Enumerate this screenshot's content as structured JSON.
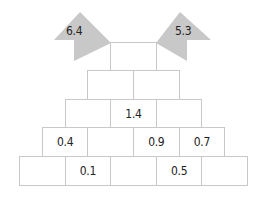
{
  "flags": [
    {
      "label": "6.4",
      "side": "left"
    },
    {
      "label": "5.3",
      "side": "right"
    }
  ],
  "rows": [
    [
      "",
      ""
    ],
    [
      "",
      "1.4",
      ""
    ],
    [
      "0.4",
      "",
      "0.9",
      "0.7"
    ],
    [
      "",
      "0.1",
      "",
      "0.5",
      ""
    ]
  ],
  "top": [
    ""
  ],
  "colors": {
    "flag": "#c8c8c8",
    "border": "#c8c8c8"
  }
}
